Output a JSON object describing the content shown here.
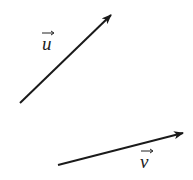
{
  "diagram": {
    "type": "vectors",
    "color": "#1a1a1a",
    "vectors": [
      {
        "name": "u",
        "label": "u",
        "from": [
          20,
          103
        ],
        "to": [
          113,
          13
        ],
        "label_pos": [
          48,
          50
        ]
      },
      {
        "name": "v",
        "label": "v",
        "from": [
          58,
          165
        ],
        "to": [
          185,
          132
        ],
        "label_pos": [
          147,
          168
        ]
      }
    ],
    "arrow_glyph": "→"
  }
}
